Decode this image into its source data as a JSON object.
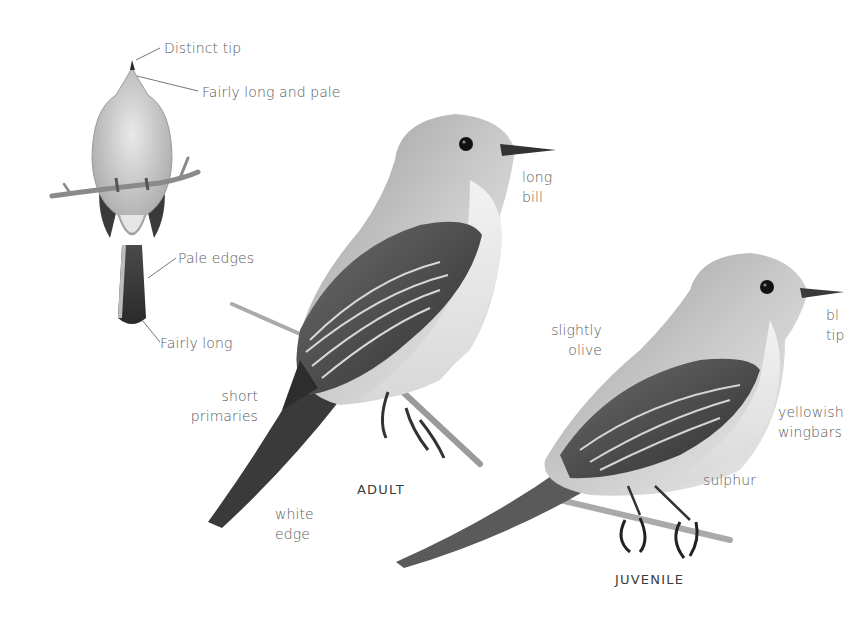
{
  "plate": {
    "subject": "Flycatcher field-guide plate",
    "background_color": "#ffffff",
    "text_color": "#5a5a5a"
  },
  "back_view": {
    "annotations": {
      "distinct_tip": "Distinct tip",
      "fairly_long_and_pale": "Fairly long and pale",
      "pale_edges": "Pale edges",
      "fairly_long": "Fairly long"
    }
  },
  "adult": {
    "caption": "ADULT",
    "annotations": {
      "long_bill": [
        "long",
        "bill"
      ],
      "short_primaries": [
        "short",
        "primaries"
      ],
      "white_edge": [
        "white",
        "edge"
      ]
    }
  },
  "juvenile": {
    "caption": "JUVENILE",
    "annotations": {
      "slightly_olive": [
        "slightly",
        "olive"
      ],
      "bill_tip_cropped": [
        "bl",
        "tip"
      ],
      "yellowish_wingbars_cropped": [
        "yellowish",
        "wingbars"
      ],
      "sulphur": "sulphur"
    }
  }
}
